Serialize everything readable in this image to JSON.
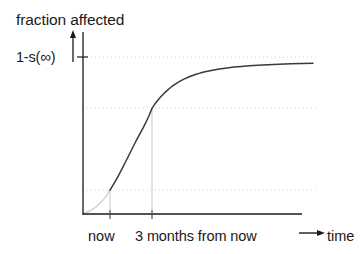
{
  "figure": {
    "width": 363,
    "height": 254,
    "background": "#ffffff",
    "ink_color": "#1a1a1a",
    "curve_color": "#3a3a3a",
    "faint_color": "#cfcfcf",
    "grid_color": "#d9d9d9"
  },
  "labels": {
    "title": "fraction affected",
    "y_tick": "1-s(∞)",
    "y_tick_base": "1-s(",
    "y_tick_symbol": "∞",
    "y_tick_close": ")",
    "x_tick_now": "now",
    "x_tick_three_months": "3 months from now",
    "x_axis_title": "time"
  },
  "icons": {
    "y_axis_up_arrow": "up-arrow-icon",
    "x_axis_right_arrow": "right-arrow-icon",
    "time_label_arrow": "right-arrow-icon"
  },
  "chart_data": {
    "type": "line",
    "title": "fraction affected",
    "xlabel": "time",
    "ylabel": "fraction affected",
    "grid": true,
    "legend": null,
    "xlim": [
      0,
      1
    ],
    "ylim": [
      0,
      1
    ],
    "axis_pixel_box": {
      "x_origin": 83,
      "y_origin": 214,
      "x_end": 300,
      "y_top": 32
    },
    "asymptote": {
      "label": "1-s(∞)",
      "value": 1.0,
      "y_pixel": 57
    },
    "gridlines_horizontal": [
      {
        "label": "1-s(∞)",
        "value": 1.0,
        "y_pixel": 57
      },
      {
        "label": "",
        "value": 0.675,
        "y_pixel": 108
      },
      {
        "label": "",
        "value": 0.145,
        "y_pixel": 190
      }
    ],
    "gridlines_vertical": [
      {
        "label": "now",
        "x_pixel": 110
      },
      {
        "label": "3 months from now",
        "x_pixel": 152
      }
    ],
    "x_ticks": [
      {
        "label": "now",
        "x_pixel": 110
      },
      {
        "label": "3 months from now",
        "x_pixel": 152
      }
    ],
    "annotated_points": [
      {
        "label": "now",
        "x_pixel": 110,
        "y_pixel": 190,
        "fraction": 0.145
      },
      {
        "label": "3 months from now",
        "x_pixel": 152,
        "y_pixel": 108,
        "fraction": 0.675
      }
    ],
    "series": [
      {
        "name": "fraction affected",
        "style": "solid",
        "color": "#3a3a3a",
        "faint_before_x_pixel": 110,
        "points_pixel": [
          [
            84,
            213
          ],
          [
            87,
            212
          ],
          [
            90,
            211
          ],
          [
            93,
            209
          ],
          [
            96,
            207
          ],
          [
            99,
            204
          ],
          [
            102,
            201
          ],
          [
            105,
            198
          ],
          [
            108,
            193
          ],
          [
            110,
            190
          ],
          [
            113,
            185
          ],
          [
            116,
            180
          ],
          [
            119,
            174
          ],
          [
            122,
            168
          ],
          [
            125,
            162
          ],
          [
            128,
            156
          ],
          [
            131,
            150
          ],
          [
            134,
            144
          ],
          [
            137,
            138
          ],
          [
            140,
            132
          ],
          [
            143,
            126
          ],
          [
            146,
            120
          ],
          [
            149,
            114
          ],
          [
            152,
            108
          ],
          [
            156,
            102
          ],
          [
            160,
            97
          ],
          [
            164,
            92
          ],
          [
            168,
            88
          ],
          [
            172,
            84
          ],
          [
            176,
            81
          ],
          [
            181,
            78
          ],
          [
            186,
            75
          ],
          [
            191,
            72
          ],
          [
            196,
            70
          ],
          [
            202,
            68
          ],
          [
            208,
            67
          ],
          [
            215,
            65
          ],
          [
            222,
            64
          ],
          [
            230,
            63
          ],
          [
            240,
            62
          ],
          [
            252,
            61
          ],
          [
            266,
            60
          ],
          [
            282,
            60
          ],
          [
            298,
            59
          ],
          [
            313,
            59
          ]
        ]
      }
    ]
  }
}
